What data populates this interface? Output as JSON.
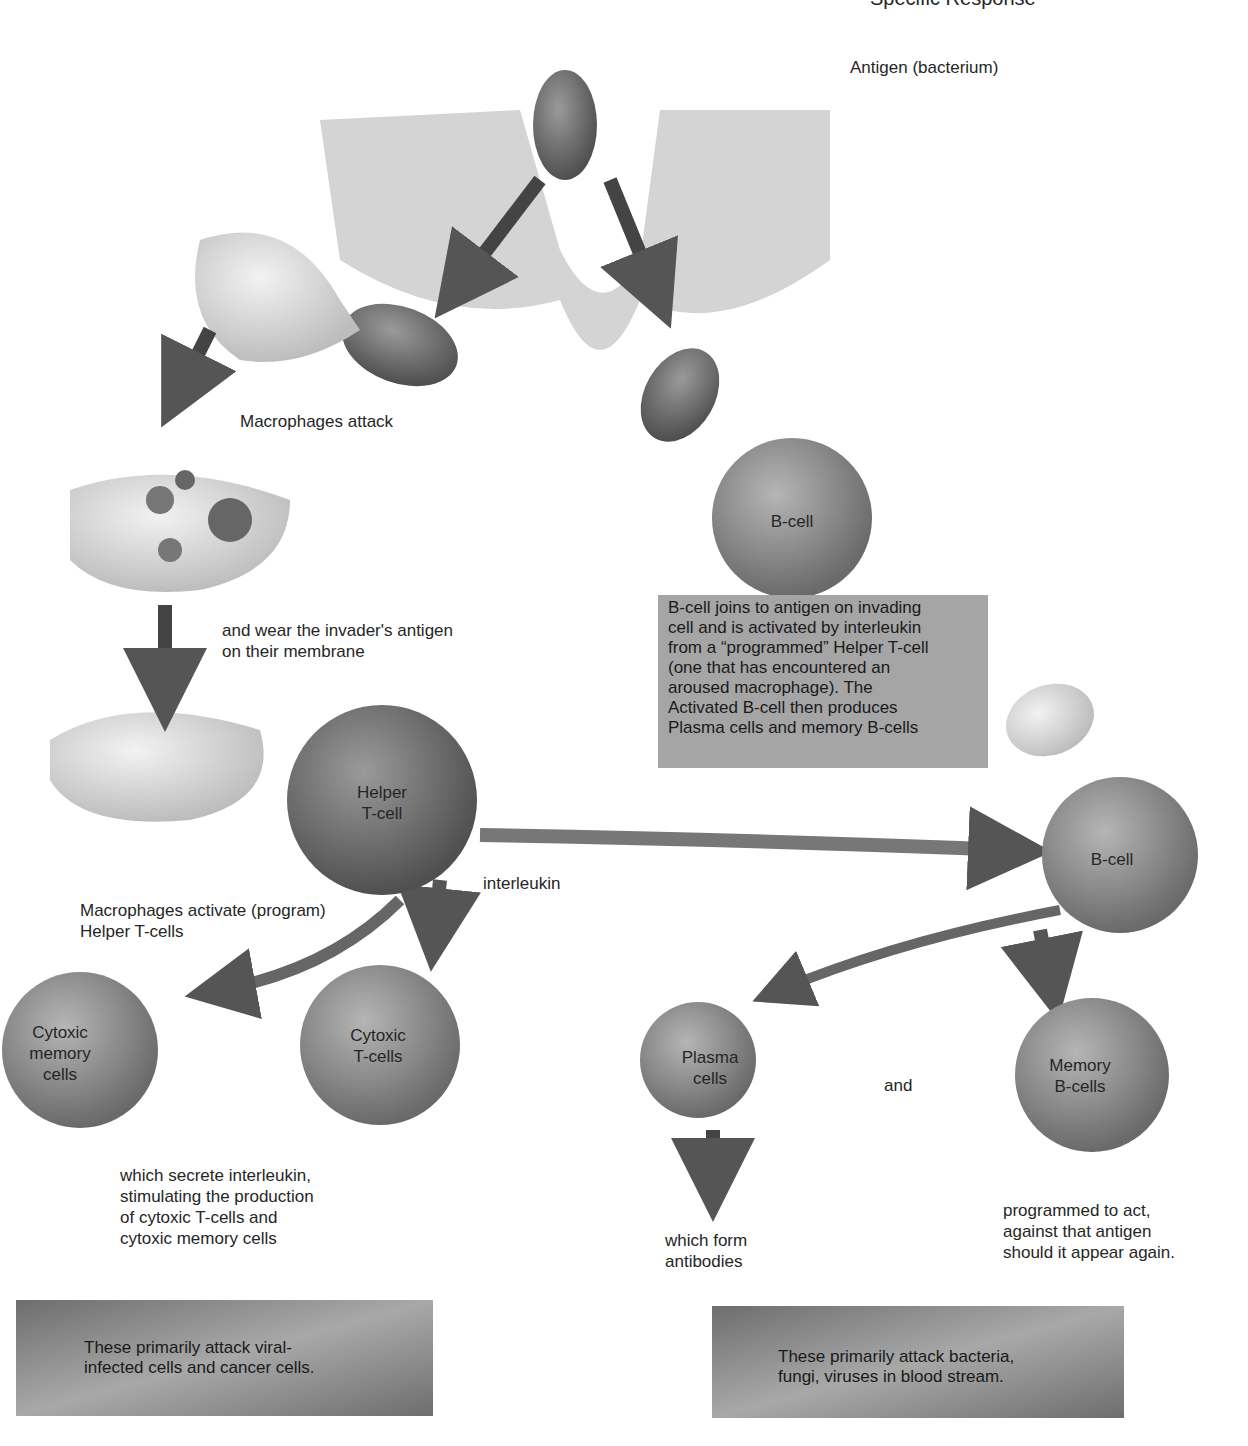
{
  "title_fragment": "Specific Response",
  "labels": {
    "antigen": "Antigen (bacterium)",
    "macrophages_attack": "Macrophages attack",
    "wear_antigen": [
      "and wear the invader's antigen",
      "on their membrane"
    ],
    "macrophages_activate": [
      "Macrophages activate (program)",
      "Helper T-cells"
    ],
    "interleukin": "interleukin",
    "secrete": [
      "which secrete interleukin,",
      "stimulating the production",
      "of cytoxic T-cells and",
      "cytoxic memory cells"
    ],
    "form_antibodies": [
      "which form",
      "antibodies"
    ],
    "and": "and",
    "programmed": [
      "programmed to act,",
      "against that antigen",
      "should it appear again."
    ]
  },
  "cells": {
    "b_cell_top": "B-cell",
    "helper": [
      "Helper",
      "T-cell"
    ],
    "b_cell_right": "B-cell",
    "cytoxic_memory": [
      "Cytoxic",
      "memory",
      "cells"
    ],
    "cytoxic_t": [
      "Cytoxic",
      "T-cells"
    ],
    "plasma": [
      "Plasma",
      "cells"
    ],
    "memory_b": [
      "Memory",
      "B-cells"
    ]
  },
  "boxes": {
    "b_cell_info": [
      "B-cell joins to antigen on invading",
      "cell and is activated by interleukin",
      "from a “programmed” Helper T-cell",
      "(one that has encountered an",
      "aroused macrophage). The",
      "Activated B-cell then produces",
      "Plasma cells and memory B-cells"
    ],
    "t_cell_summary": [
      "These primarily attack viral-",
      "infected cells and cancer cells."
    ],
    "b_cell_summary": [
      "These primarily attack bacteria,",
      "fungi, viruses in blood stream."
    ]
  }
}
